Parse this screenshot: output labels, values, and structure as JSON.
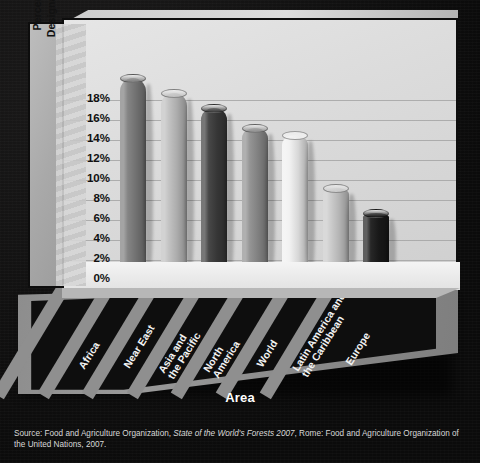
{
  "chart_data": {
    "type": "bar",
    "title": "",
    "xlabel": "Area",
    "ylabel": "Percentage of Forest Area Designated for Conservation",
    "ylabel_line1": "Percentage of Forest Area",
    "ylabel_line2": "Designated for Conservation",
    "categories": [
      "Africa",
      "Near East",
      "Asia and the Pacific",
      "North America",
      "World",
      "Latin America and the Caribbean",
      "Europe"
    ],
    "values": [
      20.0,
      18.5,
      17.0,
      15.0,
      14.3,
      9.0,
      6.5
    ],
    "value_labels": [
      "20%",
      "18.5%",
      "17%",
      "15%",
      "14.3%",
      "9%",
      "6.5%"
    ],
    "ylim": [
      0,
      20
    ],
    "ytick_values": [
      0,
      2,
      4,
      6,
      8,
      10,
      12,
      14,
      16,
      18
    ],
    "ytick_labels": [
      "0%",
      "2%",
      "4%",
      "6%",
      "8%",
      "10%",
      "12%",
      "14%",
      "16%",
      "18%"
    ],
    "grid": true,
    "legend": "none",
    "series_colors": [
      "#7d7d7d",
      "#bfbfbf",
      "#3c3c3c",
      "#8e8e8e",
      "#f0f0f0",
      "#c9c9c9",
      "#1a1a1a"
    ]
  },
  "source": {
    "prefix": "Source: Food and Agriculture Organization, ",
    "italic": "State of the World's Forests 2007",
    "suffix": ", Rome: Food and Agriculture Organization of the United Nations, 2007."
  },
  "colors": {
    "background": "#111010",
    "panel": "#dcdcdc",
    "floor": "#8d8d8d",
    "text_light": "#f2f2f2",
    "text_dark": "#111111"
  }
}
